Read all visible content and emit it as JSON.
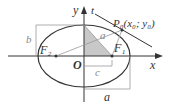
{
  "figure": {
    "type": "ellipse-diagram",
    "axes": {
      "x_label": "x",
      "y_label": "y",
      "origin_label": "O"
    },
    "foci": {
      "left": "F₂",
      "right": "F₁"
    },
    "point": {
      "name": "P₀",
      "coords": "(x₀; y₀)"
    },
    "tangent_label": "t",
    "segments": {
      "a_inside": "a",
      "a_bottom": "a",
      "b": "b",
      "c": "c"
    },
    "colors": {
      "line": "#333333",
      "shade": "#c8c8c8",
      "guide": "#999999"
    }
  }
}
